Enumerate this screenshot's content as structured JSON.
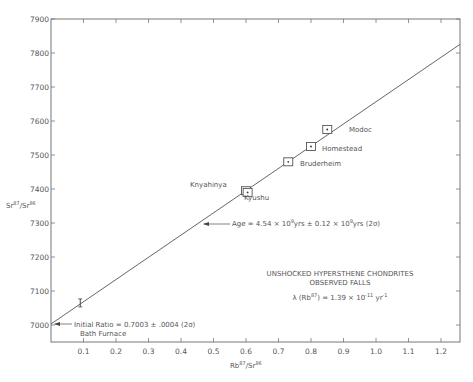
{
  "chart_data": {
    "type": "scatter",
    "title": "UNSHOCKED HYPERSTHENE CHONDRITES",
    "subtitle": "OBSERVED FALLS",
    "decay_constant": "λ (Rb87) = 1.39 × 10^-11 yr^-1",
    "xlabel": "Rb87/Sr86",
    "ylabel": "Sr87/Sr86",
    "xlim": [
      0,
      1.25
    ],
    "ylim": [
      6950,
      7900
    ],
    "x_ticks": [
      "0.1",
      "0.2",
      "0.3",
      "0.4",
      "0.5",
      "0.6",
      "0.7",
      "0.8",
      "0.9",
      "1.0",
      "1.1",
      "1.2"
    ],
    "y_ticks": [
      "7000",
      "7100",
      "7200",
      "7300",
      "7400",
      "7500",
      "7600",
      "7700",
      "7800",
      "7900"
    ],
    "grid": false,
    "points": [
      {
        "name": "Bath Furnace",
        "x": 0.09,
        "y": 7065
      },
      {
        "name": "Knyahinya",
        "x": 0.6,
        "y": 7395
      },
      {
        "name": "Kyushu",
        "x": 0.605,
        "y": 7390
      },
      {
        "name": "Bruderheim",
        "x": 0.73,
        "y": 7480
      },
      {
        "name": "Homestead",
        "x": 0.8,
        "y": 7525
      },
      {
        "name": "Modoc",
        "x": 0.85,
        "y": 7575
      }
    ],
    "isochron": {
      "x0": 0,
      "y0": 7003,
      "x1": 1.25,
      "y1": 7820
    },
    "annotations": [
      {
        "text": "Age = 4.54 × 10^9 yrs ± 0.12 × 10^9 yrs (2σ)",
        "x": 0.45,
        "y": 7300
      },
      {
        "text": "Initial Ratio = 0.7003 ± .0004 (2σ)",
        "x": 0,
        "y": 7003
      }
    ]
  },
  "labels": {
    "title": "UNSHOCKED HYPERSTHENE CHONDRITES",
    "subtitle": "OBSERVED FALLS",
    "lambda_pre": "λ (Rb",
    "lambda_sup": "87",
    "lambda_post": ") = 1.39 × 10",
    "lambda_exp": "-11",
    "lambda_unit": " yr",
    "lambda_unit_exp": "-1",
    "age_pre": "Age = 4.54 × 10",
    "age_exp1": "9",
    "age_mid": "yrs ± 0.12 × 10",
    "age_exp2": "9",
    "age_post": "yrs (2σ)",
    "initial": "Initial Ratio = 0.7003 ± .0004 (2σ)",
    "xlabel_base1": "Rb",
    "xlabel_sup1": "87",
    "xlabel_base2": "/Sr",
    "xlabel_sup2": "86",
    "ylabel_base1": "Sr",
    "ylabel_sup1": "87",
    "ylabel_base2": "/Sr",
    "ylabel_sup2": "86",
    "bath": "Bath Furnace",
    "knyahinya": "Knyahinya",
    "kyushu": "Kyushu",
    "bruderheim": "Bruderheim",
    "homestead": "Homestead",
    "modoc": "Modoc"
  }
}
